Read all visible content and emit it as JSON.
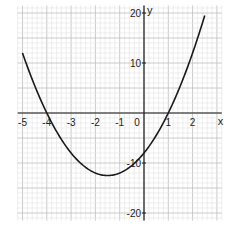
{
  "chart_data": {
    "type": "line",
    "title": "",
    "xlabel": "x",
    "ylabel": "y",
    "function": "y = 2x^2 + 6x - 8",
    "xlim": [
      -5.2,
      3.2
    ],
    "ylim": [
      -21.5,
      21.5
    ],
    "x_ticks": [
      -5,
      -4,
      -3,
      -2,
      -1,
      0,
      1,
      2
    ],
    "x_tick_labels": [
      "-5",
      "-4",
      "-3",
      "-2",
      "-1",
      "0",
      "1",
      "2"
    ],
    "y_ticks": [
      20,
      10,
      -10,
      -20
    ],
    "y_tick_labels": [
      "20",
      "10",
      "-10",
      "-20"
    ],
    "grid": true,
    "series": [
      {
        "name": "parabola",
        "x": [
          -5,
          -4.5,
          -4,
          -3.5,
          -3,
          -2.5,
          -2,
          -1.5,
          -1,
          -0.5,
          0,
          0.5,
          1,
          1.5,
          2,
          2.5
        ],
        "values": [
          12,
          5.5,
          0,
          -4.5,
          -8,
          -10.5,
          -12,
          -12.5,
          -12,
          -10.5,
          -8,
          -4.5,
          0,
          5.5,
          12,
          19.5
        ]
      }
    ],
    "annotations": {
      "roots": [
        -4,
        1
      ],
      "vertex": [
        -1.5,
        -12.5
      ],
      "y_intercept": -8
    }
  },
  "colors": {
    "curve": "#1a1a1a",
    "axis": "#1a1a1a",
    "grid_minor": "#e2e2e2",
    "grid_major": "#c4c4c4"
  }
}
